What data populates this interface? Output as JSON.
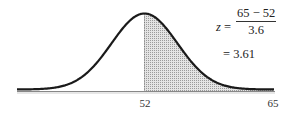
{
  "chart_data": {
    "type": "area",
    "title": "",
    "xlabel": "",
    "ylabel": "",
    "tick_labels": [
      "52",
      "65"
    ],
    "mean": 52,
    "std_dev": 3.6,
    "shaded_region": {
      "from": 52,
      "to": 65
    },
    "annotation": {
      "variable": "z",
      "equals": "=",
      "numerator": "65 − 52",
      "denominator": "3.6",
      "result_line": "= 3.61"
    },
    "grid": false,
    "legend": null
  },
  "colors": {
    "curve": "#1a1a1a",
    "shade": "#cfcfcf",
    "axis": "#555555"
  }
}
